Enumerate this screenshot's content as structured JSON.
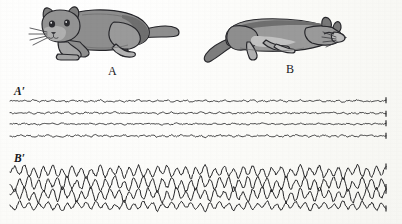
{
  "figure": {
    "background_color": "#fdfdfb",
    "ink_color": "#1a1a1c",
    "cat_fill": "#8e8e8e",
    "cat_shade": "#6f6f6f",
    "cat_light": "#bdbdbd",
    "cat_outline": "#26262a"
  },
  "panels": {
    "cat_a": {
      "label": "A",
      "caption_label": "A",
      "state": "awake-alert-crouching-cat",
      "description": "gray cat crouching, head to the left, whiskers visible, tail extended right"
    },
    "cat_b": {
      "label": "B",
      "caption_label": "B",
      "state": "sleeping-cat",
      "description": "gray cat lying down asleep, head to the right, tail curled to the left"
    },
    "trace_a": {
      "label": "A′",
      "state": "desynchronized-low-voltage-fast-eeg",
      "channel_count": 4
    },
    "trace_b": {
      "label": "B′",
      "state": "synchronized-high-voltage-slow-eeg",
      "channel_count": 4
    }
  },
  "chart_data": {
    "type": "line",
    "title": "",
    "xlabel": "",
    "ylabel": "",
    "grid": false,
    "legend": "none",
    "x_range": [
      10,
      386
    ],
    "series": [
      {
        "name": "A′ channel 1",
        "panel": "A′",
        "baseline_y": 101,
        "amplitude": 2.0,
        "frequency": "fast",
        "values": [
          0,
          0.6,
          -0.5,
          0.9,
          -0.4,
          1.4,
          -0.8,
          0.5,
          -0.3,
          1.1,
          -0.6,
          0.4,
          -0.9,
          1.0,
          -0.3,
          0.7,
          -1.2,
          0.6,
          -0.4,
          1.3,
          -0.7,
          0.3,
          -0.5,
          0.9,
          -1.0,
          0.5,
          -0.3,
          1.2,
          -0.6,
          0.4,
          -0.8,
          0.7,
          -0.2,
          1.1,
          -0.9,
          0.5,
          -0.4,
          0.8,
          -1.1,
          0.6,
          -0.3,
          1.0,
          -0.7,
          0.4,
          -0.6,
          1.2,
          -0.5,
          0.3,
          -0.9,
          0.8,
          -0.4,
          1.1,
          -0.6,
          0.5,
          -1.0,
          0.7,
          -0.3,
          0.9,
          -0.8,
          0.4,
          -0.5,
          1.2,
          -0.7,
          0.6,
          -0.4,
          1.0,
          -0.9,
          0.3,
          -0.6,
          0.8,
          -1.1,
          0.5,
          -0.4,
          1.3,
          -0.6,
          0.4,
          -0.8,
          0.9,
          -0.3,
          0.7
        ]
      },
      {
        "name": "A′ channel 2",
        "panel": "A′",
        "baseline_y": 113,
        "amplitude": 1.8,
        "frequency": "fast",
        "values": [
          0,
          -0.5,
          0.8,
          -0.3,
          1.0,
          -0.7,
          0.4,
          -1.1,
          0.6,
          -0.3,
          0.9,
          -0.5,
          1.2,
          -0.8,
          0.3,
          -0.6,
          1.0,
          -0.4,
          0.7,
          -1.0,
          0.5,
          -0.3,
          1.1,
          -0.6,
          0.4,
          -0.9,
          0.8,
          -0.5,
          1.0,
          -0.3,
          0.6,
          -1.2,
          0.7,
          -0.4,
          0.9,
          -0.6,
          0.3,
          -1.0,
          0.5,
          -0.8,
          1.1,
          -0.4,
          0.6,
          -0.7,
          1.0,
          -0.3,
          0.8,
          -1.1,
          0.4,
          -0.5,
          0.9,
          -0.6,
          1.2,
          -0.4,
          0.7,
          -0.9,
          0.3,
          -0.6,
          1.0,
          -0.8,
          0.5,
          -0.3,
          1.1,
          -0.7,
          0.4,
          -1.0,
          0.6,
          -0.4,
          0.9,
          -0.5,
          0.8,
          -1.1,
          0.3,
          -0.6,
          1.0,
          -0.4,
          0.7,
          -0.9,
          0.5,
          -0.3
        ]
      },
      {
        "name": "A′ channel 3",
        "panel": "A′",
        "baseline_y": 124,
        "amplitude": 1.6,
        "frequency": "fast",
        "values": [
          0,
          0.7,
          -0.4,
          0.9,
          -0.6,
          0.3,
          -1.0,
          0.5,
          -0.3,
          0.8,
          -0.7,
          1.1,
          -0.4,
          0.6,
          -0.9,
          0.3,
          -0.5,
          1.0,
          -0.8,
          0.4,
          -0.6,
          0.9,
          -0.3,
          0.7,
          -1.1,
          0.5,
          -0.4,
          0.8,
          -0.6,
          1.0,
          -0.3,
          0.6,
          -0.9,
          0.4,
          -0.7,
          1.1,
          -0.5,
          0.3,
          -0.8,
          0.9,
          -0.4,
          0.6,
          -1.0,
          0.7,
          -0.3,
          0.5,
          -0.8,
          1.0,
          -0.6,
          0.4,
          -0.9,
          0.7,
          -0.3,
          1.1,
          -0.5,
          0.6,
          -0.4,
          0.8,
          -1.0,
          0.3,
          -0.7,
          0.9,
          -0.5,
          0.4,
          -0.8,
          1.0,
          -0.3,
          0.6,
          -0.9,
          0.5,
          -0.4,
          0.7,
          -1.1,
          0.3,
          -0.6,
          0.8,
          -0.5,
          1.0,
          -0.4,
          0.6
        ]
      },
      {
        "name": "A′ channel 4",
        "panel": "A′",
        "baseline_y": 136,
        "amplitude": 2.1,
        "frequency": "fast",
        "values": [
          0,
          -0.8,
          1.1,
          -0.4,
          0.6,
          -1.0,
          0.5,
          -0.3,
          0.9,
          -0.7,
          0.4,
          -1.2,
          0.6,
          -0.5,
          1.0,
          -0.3,
          0.8,
          -0.6,
          1.1,
          -0.4,
          0.7,
          -0.9,
          0.3,
          -0.5,
          1.2,
          -0.8,
          0.4,
          -0.6,
          1.0,
          -0.3,
          0.7,
          -1.1,
          0.5,
          -0.4,
          0.9,
          -0.6,
          1.0,
          -0.3,
          0.8,
          -0.7,
          0.4,
          -1.2,
          0.6,
          -0.5,
          1.1,
          -0.3,
          0.7,
          -0.9,
          0.4,
          -0.6,
          1.0,
          -0.8,
          0.5,
          -0.3,
          1.1,
          -0.6,
          0.4,
          -0.9,
          0.7,
          -0.5,
          1.0,
          -0.3,
          0.8,
          -1.1,
          0.6,
          -0.4,
          0.9,
          -0.7,
          0.3,
          -0.5,
          1.2,
          -0.6,
          0.4,
          -0.8,
          1.0,
          -0.3,
          0.7,
          -0.9,
          0.5,
          -0.4
        ]
      },
      {
        "name": "B′ channel 1",
        "panel": "B′",
        "baseline_y": 172,
        "amplitude": 4.5,
        "frequency": "slow",
        "values": [
          0,
          2.8,
          -1.2,
          3.4,
          -2.0,
          1.6,
          -3.0,
          2.4,
          -1.4,
          3.6,
          -2.2,
          1.2,
          -2.6,
          3.0,
          -1.8,
          2.2,
          -3.2,
          1.4,
          -2.0,
          3.4,
          -2.6,
          1.8,
          -1.2,
          2.8,
          -3.0,
          2.0,
          -1.6,
          3.2,
          -2.4,
          1.4,
          -2.8,
          2.6,
          -1.0,
          3.0,
          -2.2,
          1.8,
          -1.4,
          2.4,
          -3.2,
          2.0,
          -1.2,
          3.4,
          -2.6,
          1.6,
          -2.0,
          3.0,
          -1.8,
          1.2,
          -2.8,
          2.4,
          -1.4,
          3.2,
          -2.0,
          1.8,
          -3.0,
          2.2,
          -1.2,
          2.6,
          -2.4,
          1.4,
          -1.8,
          3.4,
          -2.2,
          2.0,
          -1.4,
          3.0,
          -2.8,
          1.2,
          -2.0,
          2.4,
          -3.2,
          1.6,
          -1.4,
          3.6,
          -2.0,
          1.8,
          -2.6,
          2.8,
          -1.2,
          2.2
        ]
      },
      {
        "name": "B′ channel 2",
        "panel": "B′",
        "baseline_y": 184,
        "amplitude": 5.0,
        "frequency": "slow",
        "values": [
          0,
          -3.0,
          2.4,
          -1.4,
          3.6,
          -2.2,
          1.6,
          -3.2,
          2.0,
          -1.2,
          3.0,
          -2.6,
          3.4,
          -1.8,
          1.4,
          -2.4,
          3.2,
          -1.6,
          2.2,
          -3.4,
          1.8,
          -1.2,
          3.6,
          -2.0,
          1.4,
          -3.0,
          2.6,
          -1.6,
          3.2,
          -1.2,
          2.0,
          -3.6,
          2.4,
          -1.4,
          3.0,
          -2.2,
          1.2,
          -3.2,
          1.8,
          -2.6,
          3.4,
          -1.4,
          2.0,
          -2.4,
          3.0,
          -1.2,
          2.6,
          -3.4,
          1.6,
          -1.8,
          3.2,
          -2.0,
          3.6,
          -1.4,
          2.4,
          -3.0,
          1.2,
          -2.2,
          3.4,
          -2.6,
          1.8,
          -1.2,
          3.2,
          -2.4,
          1.6,
          -3.0,
          2.0,
          -1.4,
          3.4,
          -1.8,
          2.6,
          -3.2,
          1.2,
          -2.0,
          3.0,
          -1.6,
          2.4,
          -2.8,
          1.8,
          -1.2
        ]
      },
      {
        "name": "B′ channel 3",
        "panel": "B′",
        "baseline_y": 195,
        "amplitude": 4.8,
        "frequency": "slow",
        "values": [
          0,
          2.6,
          -1.6,
          3.2,
          -2.4,
          1.2,
          -3.4,
          2.0,
          -1.4,
          3.0,
          -2.8,
          3.6,
          -1.2,
          2.2,
          -3.2,
          1.4,
          -1.8,
          3.4,
          -2.6,
          1.6,
          -2.0,
          3.0,
          -1.2,
          2.4,
          -3.6,
          1.8,
          -1.4,
          3.2,
          -2.2,
          3.0,
          -1.2,
          2.0,
          -3.4,
          1.6,
          -2.6,
          3.6,
          -1.8,
          1.2,
          -2.8,
          3.2,
          -1.4,
          2.0,
          -3.0,
          2.6,
          -1.2,
          1.8,
          -2.4,
          3.4,
          -2.0,
          1.4,
          -3.2,
          2.6,
          -1.2,
          3.6,
          -1.8,
          2.2,
          -1.4,
          3.0,
          -3.4,
          1.2,
          -2.6,
          3.2,
          -1.6,
          1.4,
          -2.8,
          3.4,
          -1.2,
          2.0,
          -3.0,
          1.8,
          -1.4,
          2.6,
          -3.6,
          1.2,
          -2.2,
          3.0,
          -1.8,
          3.4,
          -1.4,
          2.0
        ]
      },
      {
        "name": "B′ channel 4",
        "panel": "B′",
        "baseline_y": 206,
        "amplitude": 3.8,
        "frequency": "slow",
        "values": [
          0,
          -2.2,
          2.8,
          -1.2,
          1.8,
          -2.6,
          1.4,
          -1.0,
          2.4,
          -2.0,
          1.2,
          -3.0,
          1.6,
          -1.4,
          2.6,
          -1.0,
          2.0,
          -1.8,
          2.8,
          -1.2,
          1.6,
          -2.4,
          1.0,
          -1.4,
          3.0,
          -2.2,
          1.2,
          -1.6,
          2.6,
          -1.0,
          1.8,
          -2.8,
          1.4,
          -1.2,
          2.4,
          -1.6,
          2.6,
          -1.0,
          2.0,
          -1.8,
          1.2,
          -3.0,
          1.6,
          -1.4,
          2.8,
          -1.0,
          1.8,
          -2.4,
          1.2,
          -1.6,
          2.6,
          -2.0,
          1.4,
          -1.0,
          2.8,
          -1.6,
          1.2,
          -2.4,
          1.8,
          -1.4,
          2.6,
          -1.0,
          2.0,
          -2.8,
          1.6,
          -1.2,
          2.4,
          -1.8,
          1.0,
          -1.4,
          3.0,
          -1.6,
          1.2,
          -2.0,
          2.6,
          -1.0,
          1.8,
          -2.4,
          1.4,
          -1.2
        ]
      }
    ]
  }
}
